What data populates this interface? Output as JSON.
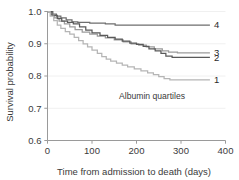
{
  "chart_data": {
    "type": "line",
    "title": "",
    "xlabel": "Time from admission to death (days)",
    "ylabel": "Survival probability",
    "xlim": [
      0,
      400
    ],
    "ylim": [
      0.6,
      1.0
    ],
    "xticks": [
      "0",
      "100",
      "200",
      "300",
      "400"
    ],
    "xtick_values": [
      0,
      100,
      200,
      300,
      400
    ],
    "yticks": [
      "0.6",
      "0.7",
      "0.8",
      "0.9",
      "1.0"
    ],
    "ytick_values": [
      0.6,
      0.7,
      0.8,
      0.9,
      1.0
    ],
    "grid": "horizontal",
    "legend_position": "right-of-curve-ends",
    "annotation": "Albumin quartiles",
    "series": [
      {
        "name": "4",
        "label": "4",
        "color": "#6e6e6e",
        "end_value": 0.958,
        "points": [
          [
            0,
            1.0
          ],
          [
            12,
            1.0
          ],
          [
            12,
            0.992
          ],
          [
            20,
            0.992
          ],
          [
            20,
            0.986
          ],
          [
            30,
            0.986
          ],
          [
            30,
            0.98
          ],
          [
            42,
            0.98
          ],
          [
            42,
            0.974
          ],
          [
            55,
            0.974
          ],
          [
            55,
            0.968
          ],
          [
            68,
            0.968
          ],
          [
            68,
            0.966
          ],
          [
            95,
            0.966
          ],
          [
            95,
            0.964
          ],
          [
            130,
            0.964
          ],
          [
            130,
            0.962
          ],
          [
            152,
            0.962
          ],
          [
            152,
            0.958
          ],
          [
            365,
            0.958
          ]
        ]
      },
      {
        "name": "3",
        "label": "3",
        "color": "#9c9c9c",
        "end_value": 0.872,
        "points": [
          [
            0,
            1.0
          ],
          [
            8,
            1.0
          ],
          [
            8,
            0.99
          ],
          [
            16,
            0.99
          ],
          [
            16,
            0.98
          ],
          [
            26,
            0.98
          ],
          [
            26,
            0.97
          ],
          [
            38,
            0.97
          ],
          [
            38,
            0.962
          ],
          [
            50,
            0.962
          ],
          [
            50,
            0.952
          ],
          [
            62,
            0.952
          ],
          [
            62,
            0.944
          ],
          [
            78,
            0.944
          ],
          [
            78,
            0.936
          ],
          [
            95,
            0.936
          ],
          [
            95,
            0.93
          ],
          [
            112,
            0.93
          ],
          [
            112,
            0.924
          ],
          [
            130,
            0.924
          ],
          [
            130,
            0.918
          ],
          [
            150,
            0.918
          ],
          [
            150,
            0.912
          ],
          [
            170,
            0.912
          ],
          [
            170,
            0.906
          ],
          [
            188,
            0.906
          ],
          [
            188,
            0.9
          ],
          [
            205,
            0.9
          ],
          [
            205,
            0.896
          ],
          [
            222,
            0.896
          ],
          [
            222,
            0.89
          ],
          [
            240,
            0.89
          ],
          [
            240,
            0.884
          ],
          [
            258,
            0.884
          ],
          [
            258,
            0.878
          ],
          [
            272,
            0.878
          ],
          [
            272,
            0.874
          ],
          [
            292,
            0.874
          ],
          [
            292,
            0.872
          ],
          [
            365,
            0.872
          ]
        ]
      },
      {
        "name": "2",
        "label": "2",
        "color": "#5a5a5a",
        "end_value": 0.858,
        "points": [
          [
            0,
            1.0
          ],
          [
            10,
            1.0
          ],
          [
            10,
            0.988
          ],
          [
            22,
            0.988
          ],
          [
            22,
            0.978
          ],
          [
            32,
            0.978
          ],
          [
            32,
            0.97
          ],
          [
            45,
            0.97
          ],
          [
            45,
            0.966
          ],
          [
            58,
            0.966
          ],
          [
            58,
            0.962
          ],
          [
            72,
            0.962
          ],
          [
            72,
            0.952
          ],
          [
            86,
            0.952
          ],
          [
            86,
            0.942
          ],
          [
            100,
            0.942
          ],
          [
            100,
            0.934
          ],
          [
            118,
            0.934
          ],
          [
            118,
            0.926
          ],
          [
            135,
            0.926
          ],
          [
            135,
            0.92
          ],
          [
            152,
            0.92
          ],
          [
            152,
            0.914
          ],
          [
            168,
            0.914
          ],
          [
            168,
            0.908
          ],
          [
            185,
            0.908
          ],
          [
            185,
            0.902
          ],
          [
            200,
            0.902
          ],
          [
            200,
            0.898
          ],
          [
            215,
            0.898
          ],
          [
            215,
            0.892
          ],
          [
            228,
            0.892
          ],
          [
            228,
            0.884
          ],
          [
            242,
            0.884
          ],
          [
            242,
            0.878
          ],
          [
            255,
            0.878
          ],
          [
            255,
            0.87
          ],
          [
            266,
            0.87
          ],
          [
            266,
            0.862
          ],
          [
            280,
            0.862
          ],
          [
            280,
            0.858
          ],
          [
            365,
            0.858
          ]
        ]
      },
      {
        "name": "1",
        "label": "1",
        "color": "#b5b5b5",
        "end_value": 0.788,
        "points": [
          [
            0,
            1.0
          ],
          [
            6,
            1.0
          ],
          [
            6,
            0.986
          ],
          [
            14,
            0.986
          ],
          [
            14,
            0.972
          ],
          [
            22,
            0.972
          ],
          [
            22,
            0.958
          ],
          [
            30,
            0.958
          ],
          [
            30,
            0.948
          ],
          [
            40,
            0.948
          ],
          [
            40,
            0.938
          ],
          [
            50,
            0.938
          ],
          [
            50,
            0.93
          ],
          [
            60,
            0.93
          ],
          [
            60,
            0.92
          ],
          [
            70,
            0.92
          ],
          [
            70,
            0.91
          ],
          [
            80,
            0.91
          ],
          [
            80,
            0.9
          ],
          [
            90,
            0.9
          ],
          [
            90,
            0.89
          ],
          [
            100,
            0.89
          ],
          [
            100,
            0.88
          ],
          [
            112,
            0.88
          ],
          [
            112,
            0.87
          ],
          [
            122,
            0.87
          ],
          [
            122,
            0.86
          ],
          [
            132,
            0.86
          ],
          [
            132,
            0.852
          ],
          [
            142,
            0.852
          ],
          [
            142,
            0.846
          ],
          [
            155,
            0.846
          ],
          [
            155,
            0.84
          ],
          [
            168,
            0.84
          ],
          [
            168,
            0.834
          ],
          [
            180,
            0.834
          ],
          [
            180,
            0.828
          ],
          [
            195,
            0.828
          ],
          [
            195,
            0.822
          ],
          [
            210,
            0.822
          ],
          [
            210,
            0.816
          ],
          [
            225,
            0.816
          ],
          [
            225,
            0.81
          ],
          [
            238,
            0.81
          ],
          [
            238,
            0.804
          ],
          [
            250,
            0.804
          ],
          [
            250,
            0.798
          ],
          [
            262,
            0.798
          ],
          [
            262,
            0.792
          ],
          [
            275,
            0.792
          ],
          [
            275,
            0.788
          ],
          [
            365,
            0.788
          ]
        ]
      }
    ]
  }
}
